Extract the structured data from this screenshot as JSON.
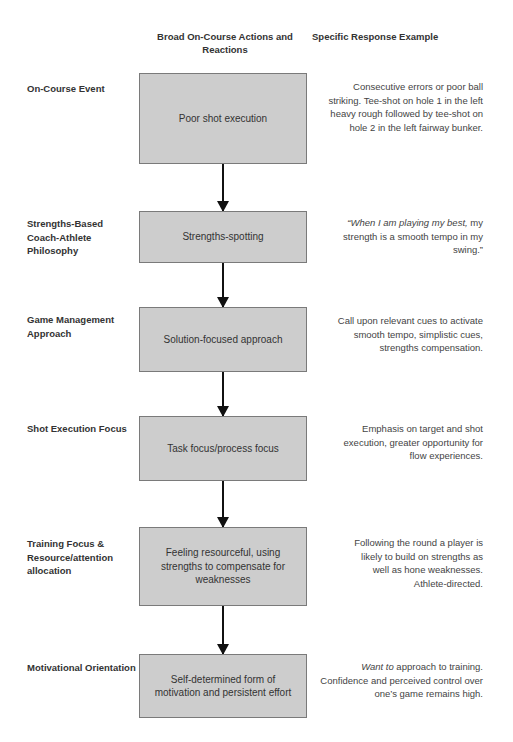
{
  "headers": {
    "middle": "Broad On-Course Actions and Reactions",
    "right": "Specific Response Example"
  },
  "rows": [
    {
      "label": "On-Course Event",
      "box": "Poor shot execution",
      "response": "Consecutive errors or poor ball striking. Tee-shot on hole 1 in the left heavy rough followed by tee-shot on hole 2 in the left fairway bunker."
    },
    {
      "label": "Strengths-Based Coach-Athlete Philosophy",
      "box": "Strengths-spotting",
      "response_italic": "“When I am playing my best,",
      "response": " my strength is a smooth tempo in my swing.”"
    },
    {
      "label": "Game Management Approach",
      "box": "Solution-focused approach",
      "response": "Call upon relevant cues to activate smooth tempo, simplistic cues, strengths compensation."
    },
    {
      "label": "Shot Execution Focus",
      "box": "Task focus/process focus",
      "response": "Emphasis on target and shot execution, greater opportunity for flow experiences."
    },
    {
      "label": "Training Focus & Resource/attention allocation",
      "box": "Feeling resourceful, using strengths to compensate for weaknesses",
      "response": "Following the round a player is likely to build on strengths as well as hone weaknesses. Athlete-directed."
    },
    {
      "label": "Motivational Orientation",
      "box": "Self-determined form of motivation and persistent effort",
      "response_italic": "Want to",
      "response": " approach to training. Confidence and perceived control over one’s game remains high."
    }
  ],
  "colors": {
    "box_fill": "#cdcdcd",
    "box_border": "#7a7a7a",
    "arrow": "#111111"
  }
}
